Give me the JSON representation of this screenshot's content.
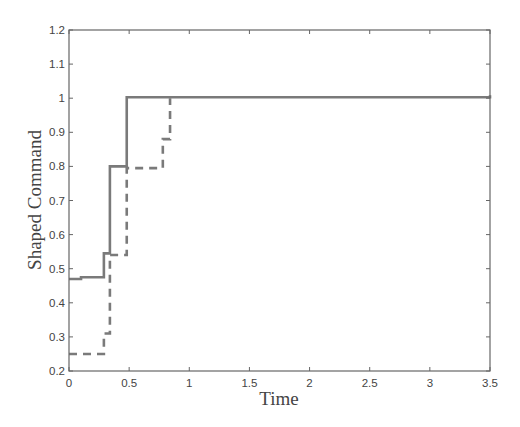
{
  "chart_data": {
    "type": "line",
    "title": "",
    "xlabel": "Time",
    "ylabel": "Shaped Command",
    "xlim": [
      0,
      3.5
    ],
    "ylim": [
      0.2,
      1.2
    ],
    "xticks": [
      0,
      0.5,
      1,
      1.5,
      2,
      2.5,
      3,
      3.5
    ],
    "xtick_labels": [
      "0",
      "0.5",
      "1",
      "1.5",
      "2",
      "2.5",
      "3",
      "3.5"
    ],
    "yticks": [
      0.2,
      0.3,
      0.4,
      0.5,
      0.6,
      0.7,
      0.8,
      0.9,
      1.0,
      1.1,
      1.2
    ],
    "ytick_labels": [
      "0.2",
      "0.3",
      "0.4",
      "0.5",
      "0.6",
      "0.7",
      "0.8",
      "0.9",
      "1",
      "1.1",
      "1.2"
    ],
    "grid": false,
    "legend": null,
    "line_color": "#7a7a7a",
    "series": [
      {
        "name": "solid",
        "style": "solid",
        "step": true,
        "x": [
          0,
          0.1,
          0.29,
          0.34,
          0.48,
          3.5
        ],
        "values": [
          0.47,
          0.475,
          0.545,
          0.8,
          1.003,
          1.009
        ]
      },
      {
        "name": "dashed",
        "style": "dashed",
        "step": true,
        "x": [
          0,
          0.29,
          0.34,
          0.48,
          0.78,
          0.84
        ],
        "values": [
          0.25,
          0.31,
          0.54,
          0.795,
          0.88,
          1.0
        ]
      }
    ]
  }
}
